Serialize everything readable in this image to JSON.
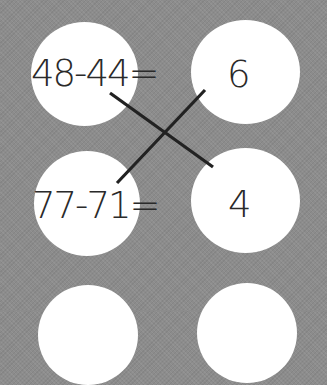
{
  "worksheet": {
    "problems": [
      {
        "expression": "48-44="
      },
      {
        "expression": "77-71="
      }
    ],
    "answers": [
      {
        "value": "6"
      },
      {
        "value": "4"
      }
    ],
    "connections": [
      {
        "from": "48-44=",
        "to": "4"
      },
      {
        "from": "77-71=",
        "to": "6"
      }
    ]
  },
  "colors": {
    "background": "#8c8c8c",
    "circle": "#ffffff",
    "text": "#2a2a2a",
    "line": "#222222"
  }
}
